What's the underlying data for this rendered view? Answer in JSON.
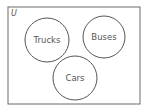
{
  "diagram": {
    "type": "venn",
    "universal_label": "U",
    "sets": [
      {
        "label": "Trucks",
        "cx": 47,
        "cy": 40,
        "r": 22
      },
      {
        "label": "Buses",
        "cx": 104,
        "cy": 37,
        "r": 21
      },
      {
        "label": "Cars",
        "cx": 75,
        "cy": 78,
        "r": 22
      }
    ],
    "colors": {
      "stroke": "#555555",
      "background": "#ffffff"
    }
  }
}
